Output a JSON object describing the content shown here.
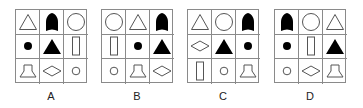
{
  "options": [
    {
      "label": "A",
      "left": 15,
      "cells": [
        "triangle-outline",
        "bullet-filled",
        "circle-outline",
        "dot-filled",
        "triangle-filled",
        "rectangle-outline",
        "trapezoid-outline",
        "diamond-outline",
        "small-circle-outline"
      ]
    },
    {
      "label": "B",
      "left": 101,
      "cells": [
        "circle-outline",
        "triangle-outline",
        "bullet-filled",
        "rectangle-outline",
        "dot-filled",
        "triangle-filled",
        "small-circle-outline",
        "trapezoid-outline",
        "diamond-outline"
      ]
    },
    {
      "label": "C",
      "left": 187,
      "cells": [
        "triangle-outline",
        "circle-outline",
        "bullet-filled",
        "diamond-outline",
        "triangle-filled",
        "dot-filled",
        "rectangle-outline",
        "small-circle-outline",
        "trapezoid-outline"
      ]
    },
    {
      "label": "D",
      "left": 274,
      "cells": [
        "bullet-filled",
        "circle-outline",
        "triangle-outline",
        "dot-filled",
        "rectangle-outline",
        "triangle-filled",
        "small-circle-outline",
        "diamond-outline",
        "trapezoid-outline"
      ]
    }
  ],
  "colors": {
    "stroke": "#555555",
    "fill": "#000000",
    "grid": "#8a8a8a"
  }
}
